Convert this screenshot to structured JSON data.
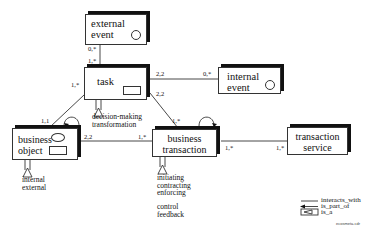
{
  "diagram": {
    "nodes": {
      "external_event": {
        "label": "external\nevent",
        "icon": "circle-icon"
      },
      "task": {
        "label": "task",
        "icon": "rect-icon"
      },
      "internal_event": {
        "label": "internal\nevent",
        "icon": "circle-icon"
      },
      "business_object": {
        "label": "business\nobject",
        "icons": [
          "ellipse-icon",
          "rect-icon"
        ]
      },
      "business_transaction": {
        "label": "business\ntransaction",
        "icon": "arrow-icon"
      },
      "transaction_service": {
        "label": "transaction\nservice"
      }
    },
    "cardinalities": {
      "ext_event_side": "0,*",
      "task_from_ext_event": "1,*",
      "task_to_internal_event": "2,2",
      "internal_event_side": "0,*",
      "task_to_business_transaction": "2,2",
      "business_transaction_from_task": "1,*",
      "task_to_business_object": "1,*",
      "business_object_from_task": "1,1",
      "business_object_to_transaction": "2,2",
      "transaction_from_business_object": "1,*",
      "transaction_to_service": "1,*",
      "service_from_transaction": "1,*"
    },
    "specializations": {
      "task": "decision-making\ntransformation",
      "business_object": "internal\nexternal",
      "business_transaction_1": "initiating\ncontracting\nenforcing",
      "business_transaction_2": "control\nfeedback"
    },
    "legend": {
      "items": [
        {
          "symbol": "line",
          "label": "interacts_with"
        },
        {
          "symbol": "arrow",
          "label": "is_part_of"
        },
        {
          "symbol": "triangle",
          "label": "is_a"
        }
      ]
    },
    "caption": "ecosmeta.cdr"
  }
}
